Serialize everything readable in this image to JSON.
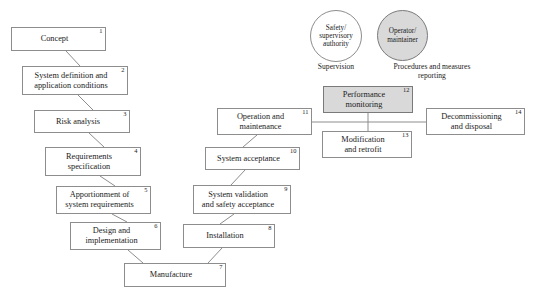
{
  "diagram": {
    "style": {
      "box_fill": "#ffffff",
      "shaded_fill": "#d9d9d9",
      "stroke": "#8d8d8d",
      "text": "#1a1a1a",
      "background": "#ffffff"
    },
    "nodes": [
      {
        "id": 1,
        "number": "1",
        "label": "Concept",
        "shaded": false,
        "x": 11,
        "y": 27,
        "w": 95,
        "h": 24
      },
      {
        "id": 2,
        "number": "2",
        "label": "System definition and\napplication conditions",
        "shaded": false,
        "x": 22,
        "y": 66,
        "w": 106,
        "h": 29
      },
      {
        "id": 3,
        "number": "3",
        "label": "Risk analysis",
        "shaded": false,
        "x": 34,
        "y": 110,
        "w": 96,
        "h": 23
      },
      {
        "id": 4,
        "number": "4",
        "label": "Requirements\nspecification",
        "shaded": false,
        "x": 45,
        "y": 147,
        "w": 96,
        "h": 29
      },
      {
        "id": 5,
        "number": "5",
        "label": "Apportionment of\nsystem requirements",
        "shaded": false,
        "x": 56,
        "y": 186,
        "w": 95,
        "h": 28
      },
      {
        "id": 6,
        "number": "6",
        "label": "Design and\nimplementation",
        "shaded": false,
        "x": 70,
        "y": 222,
        "w": 91,
        "h": 28
      },
      {
        "id": 7,
        "number": "7",
        "label": "Manufacture",
        "shaded": false,
        "x": 124,
        "y": 263,
        "w": 102,
        "h": 24
      },
      {
        "id": 8,
        "number": "8",
        "label": "Installation",
        "shaded": false,
        "x": 183,
        "y": 224,
        "w": 92,
        "h": 24
      },
      {
        "id": 9,
        "number": "9",
        "label": "System validation\nand safety acceptance",
        "shaded": false,
        "x": 193,
        "y": 185,
        "w": 98,
        "h": 29
      },
      {
        "id": 10,
        "number": "10",
        "label": "System acceptance",
        "shaded": false,
        "x": 205,
        "y": 147,
        "w": 95,
        "h": 23
      },
      {
        "id": 11,
        "number": "11",
        "label": "Operation and\nmaintenance",
        "shaded": false,
        "x": 217,
        "y": 108,
        "w": 95,
        "h": 27
      },
      {
        "id": 12,
        "number": "12",
        "label": "Performance\nmonitoring",
        "shaded": true,
        "x": 323,
        "y": 86,
        "w": 90,
        "h": 27
      },
      {
        "id": 13,
        "number": "13",
        "label": "Modification\nand retrofit",
        "shaded": false,
        "x": 322,
        "y": 131,
        "w": 90,
        "h": 27
      },
      {
        "id": 14,
        "number": "14",
        "label": "Decommissioning\nand disposal",
        "shaded": false,
        "x": 426,
        "y": 108,
        "w": 99,
        "h": 27
      }
    ],
    "circles": [
      {
        "id": "c1",
        "label": "Safety/\nsupervisory\nauthority",
        "shaded": false,
        "x": 310,
        "y": 10,
        "d": 52
      },
      {
        "id": "c2",
        "label": "Operator/\nmaintainer",
        "shaded": true,
        "x": 377,
        "y": 10,
        "d": 51
      }
    ],
    "captions": [
      {
        "id": "cap1",
        "text": "Supervision",
        "x": 300,
        "y": 63,
        "w": 72
      },
      {
        "id": "cap2",
        "text": "Procedures and measures\nreporting",
        "x": 372,
        "y": 63,
        "w": 120
      }
    ],
    "links": [
      {
        "from": 1,
        "to": 2,
        "type": "diagonal",
        "x1": 66,
        "y1": 51,
        "x2": 80,
        "y2": 66
      },
      {
        "from": 2,
        "to": 3,
        "type": "diagonal",
        "x1": 78,
        "y1": 95,
        "x2": 93,
        "y2": 110
      },
      {
        "from": 3,
        "to": 4,
        "type": "diagonal",
        "x1": 89,
        "y1": 133,
        "x2": 104,
        "y2": 147
      },
      {
        "from": 4,
        "to": 5,
        "type": "diagonal",
        "x1": 100,
        "y1": 176,
        "x2": 115,
        "y2": 186
      },
      {
        "from": 5,
        "to": 6,
        "type": "diagonal",
        "x1": 112,
        "y1": 214,
        "x2": 127,
        "y2": 222
      },
      {
        "from": 6,
        "to": 7,
        "type": "diagonal",
        "x1": 128,
        "y1": 250,
        "x2": 143,
        "y2": 263
      },
      {
        "from": 7,
        "to": 8,
        "type": "diagonal",
        "x1": 208,
        "y1": 263,
        "x2": 222,
        "y2": 248
      },
      {
        "from": 8,
        "to": 9,
        "type": "diagonal",
        "x1": 220,
        "y1": 224,
        "x2": 234,
        "y2": 214
      },
      {
        "from": 9,
        "to": 10,
        "type": "diagonal",
        "x1": 231,
        "y1": 185,
        "x2": 245,
        "y2": 170
      },
      {
        "from": 10,
        "to": 11,
        "type": "diagonal",
        "x1": 243,
        "y1": 147,
        "x2": 257,
        "y2": 135
      },
      {
        "from": 11,
        "to": 14,
        "type": "orthogonal",
        "x1": 312,
        "y1": 122,
        "x2": 426,
        "y2": 122
      },
      {
        "from": 12,
        "to": 11,
        "type": "orthogonal",
        "x1": 368,
        "y1": 113,
        "x2": 368,
        "y2": 122
      },
      {
        "from": 13,
        "to": 11,
        "type": "orthogonal",
        "x1": 368,
        "y1": 122,
        "x2": 368,
        "y2": 131
      }
    ]
  }
}
